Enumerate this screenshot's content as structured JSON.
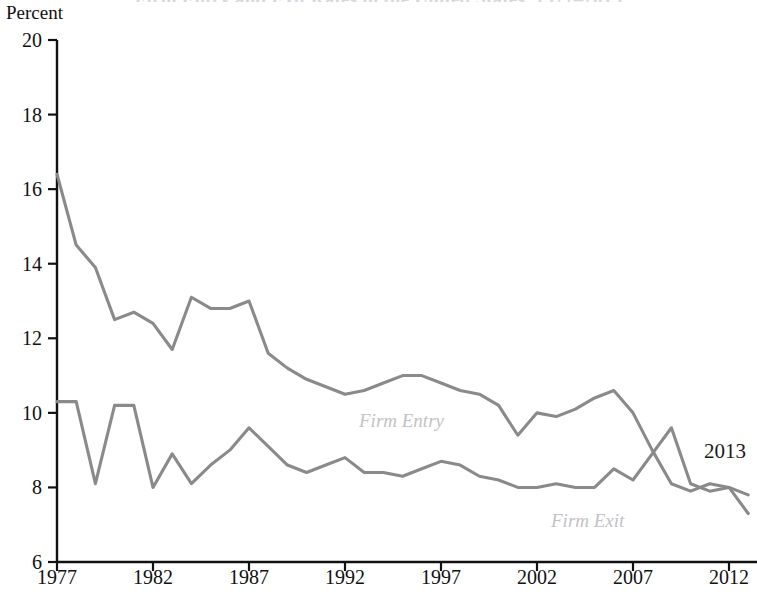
{
  "figure": {
    "title_clipped": "Firm Entry and Exit Rates in the United States, 1977–2013",
    "y_axis_unit_label": "Percent",
    "annotation_2013": "2013"
  },
  "series_labels": {
    "entry": "Firm Entry",
    "exit": "Firm Exit"
  },
  "colors": {
    "entry_line": "#8a8a8a",
    "exit_line": "#8a8a8a",
    "axis": "#111111",
    "series_label_text": "#c2c2c6",
    "annotation_text": "#1a1a1a",
    "background": "#ffffff"
  },
  "chart_data": {
    "type": "line",
    "title": "Firm Entry and Exit Rates in the United States, 1977–2013",
    "xlabel": "",
    "ylabel": "Percent",
    "xlim": [
      1977,
      2013
    ],
    "ylim": [
      6,
      20
    ],
    "yticks": [
      6,
      8,
      10,
      12,
      14,
      16,
      18,
      20
    ],
    "xticks": [
      1977,
      1982,
      1987,
      1992,
      1997,
      2002,
      2007,
      2012
    ],
    "ytick_labels": [
      "6",
      "8",
      "10",
      "12",
      "14",
      "16",
      "18",
      "20"
    ],
    "xtick_labels": [
      "1977",
      "1982",
      "1987",
      "1992",
      "1997",
      "2002",
      "2007",
      "2012"
    ],
    "grid": false,
    "legend_position": "inline-annotations",
    "x": [
      1977,
      1978,
      1979,
      1980,
      1981,
      1982,
      1983,
      1984,
      1985,
      1986,
      1987,
      1988,
      1989,
      1990,
      1991,
      1992,
      1993,
      1994,
      1995,
      1996,
      1997,
      1998,
      1999,
      2000,
      2001,
      2002,
      2003,
      2004,
      2005,
      2006,
      2007,
      2008,
      2009,
      2010,
      2011,
      2012,
      2013
    ],
    "series": [
      {
        "name": "Firm Entry",
        "values": [
          16.4,
          14.5,
          13.9,
          12.5,
          12.7,
          12.4,
          11.7,
          13.1,
          12.8,
          12.8,
          13.0,
          11.6,
          11.2,
          10.9,
          10.7,
          10.5,
          10.6,
          10.8,
          11.0,
          11.0,
          10.8,
          10.6,
          10.5,
          10.2,
          9.4,
          10.0,
          9.9,
          10.1,
          10.4,
          10.6,
          10.0,
          9.0,
          8.1,
          7.9,
          8.1,
          8.0,
          7.8
        ]
      },
      {
        "name": "Firm Exit",
        "values": [
          10.3,
          10.3,
          8.1,
          10.2,
          10.2,
          8.0,
          8.9,
          8.1,
          8.6,
          9.0,
          9.6,
          9.1,
          8.6,
          8.4,
          8.6,
          8.8,
          8.4,
          8.4,
          8.3,
          8.5,
          8.7,
          8.6,
          8.3,
          8.2,
          8.0,
          8.0,
          8.1,
          8.0,
          8.0,
          8.5,
          8.2,
          8.9,
          9.6,
          8.1,
          7.9,
          8.0,
          7.3
        ]
      }
    ],
    "annotations": [
      {
        "text": "Firm Entry",
        "x": 1992.5,
        "y": 9.8,
        "role": "series-label"
      },
      {
        "text": "Firm Exit",
        "x": 2003.0,
        "y": 7.0,
        "role": "series-label"
      },
      {
        "text": "2013",
        "x": 2013.0,
        "y": 9.0,
        "role": "endpoint-year"
      }
    ]
  }
}
